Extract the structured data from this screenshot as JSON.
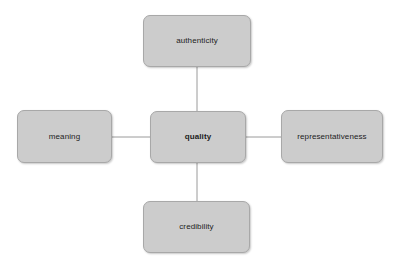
{
  "diagram": {
    "type": "radial-concept-map",
    "background_color": "#ffffff",
    "node_fill_color": "#cccccc",
    "node_border_color": "#a8a8a8",
    "edge_color": "#9a9a9a",
    "text_color": "#1c1c1c",
    "center": {
      "id": "quality",
      "label": "quality",
      "emphasis": "bold",
      "x": 150,
      "y": 111,
      "width": 96,
      "height": 52
    },
    "nodes": [
      {
        "id": "authenticity",
        "label": "authenticity",
        "position": "top",
        "x": 143,
        "y": 15,
        "width": 108,
        "height": 52
      },
      {
        "id": "meaning",
        "label": "meaning",
        "position": "left",
        "x": 17,
        "y": 110,
        "width": 95,
        "height": 53
      },
      {
        "id": "representativeness",
        "label": "representativeness",
        "position": "right",
        "x": 281,
        "y": 110,
        "width": 102,
        "height": 53
      },
      {
        "id": "credibility",
        "label": "credibility",
        "position": "bottom",
        "x": 143,
        "y": 201,
        "width": 107,
        "height": 52
      }
    ],
    "edges": [
      {
        "id": "quality-authenticity",
        "from": "quality",
        "to": "authenticity",
        "x1": 197,
        "y1": 111,
        "x2": 197,
        "y2": 67
      },
      {
        "id": "quality-meaning",
        "from": "quality",
        "to": "meaning",
        "x1": 150,
        "y1": 137,
        "x2": 112,
        "y2": 137
      },
      {
        "id": "quality-representativeness",
        "from": "quality",
        "to": "representativeness",
        "x1": 246,
        "y1": 137,
        "x2": 281,
        "y2": 137
      },
      {
        "id": "quality-credibility",
        "from": "quality",
        "to": "credibility",
        "x1": 197,
        "y1": 163,
        "x2": 197,
        "y2": 201
      }
    ]
  }
}
